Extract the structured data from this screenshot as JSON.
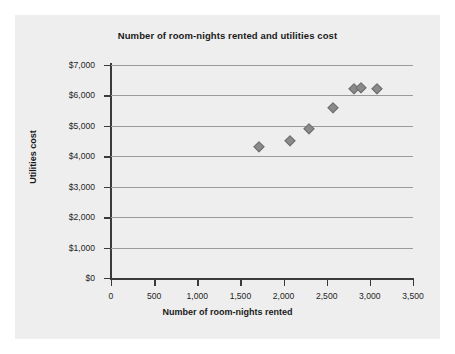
{
  "chart_data": {
    "type": "scatter",
    "title": "Number of room-nights rented and utilities cost",
    "xlabel": "Number of room-nights rented",
    "ylabel": "Utilities cost",
    "xlim": [
      0,
      3500
    ],
    "ylim": [
      0,
      7000
    ],
    "grid": "horizontal",
    "legend": "none",
    "marker_color": "#8a8a8a",
    "marker_shape": "diamond",
    "xticks": [
      0,
      500,
      1000,
      1500,
      2000,
      2500,
      3000,
      3500
    ],
    "xtick_labels": [
      "0",
      "500",
      "1,000",
      "1,500",
      "2,000",
      "2,500",
      "3,000",
      "3,500"
    ],
    "yticks": [
      0,
      1000,
      2000,
      3000,
      4000,
      5000,
      6000,
      7000
    ],
    "ytick_labels": [
      "$0",
      "$1,000",
      "$2,000",
      "$3,000",
      "$4,000",
      "$5,000",
      "$6,000",
      "$7,000"
    ],
    "points": [
      {
        "x": 1720,
        "y": 4300
      },
      {
        "x": 2070,
        "y": 4500
      },
      {
        "x": 2290,
        "y": 4900
      },
      {
        "x": 2570,
        "y": 5600
      },
      {
        "x": 2820,
        "y": 6200
      },
      {
        "x": 2900,
        "y": 6250
      },
      {
        "x": 3080,
        "y": 6200
      }
    ]
  }
}
